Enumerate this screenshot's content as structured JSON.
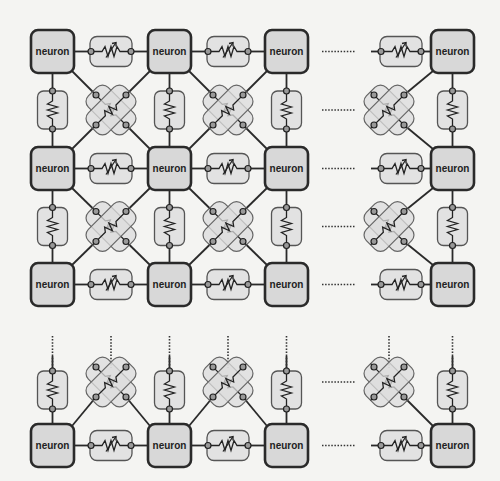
{
  "diagram": {
    "title": "",
    "neuron_label": "neuron",
    "colors": {
      "background": "#f4f4f2",
      "neuron_fill": "#d8d8d8",
      "neuron_stroke": "#2a2a2a",
      "memristor_fill": "#e2e2e2",
      "memristor_stroke": "#555555"
    },
    "grid": {
      "neuron_size": 43,
      "columns_x": [
        31,
        148,
        265,
        431
      ],
      "rows_y": [
        30,
        147,
        263,
        424
      ],
      "ellipsis_after_column": 2,
      "ellipsis_after_row": 2
    },
    "legend": {
      "neuron": "neuron",
      "horizontal_link": "memristor (horizontal synapse)",
      "vertical_link": "resistor (vertical synapse)",
      "diagonal_link": "crossed memristor pair (diagonal synapse)",
      "ellipsis": "dotted continuation"
    }
  }
}
